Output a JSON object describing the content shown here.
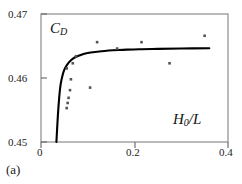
{
  "panel": {
    "label": "(a)"
  },
  "axes": {
    "x_ticks": [
      "0",
      "0.2",
      "0.4"
    ],
    "y_ticks": [
      "0.47",
      "0.46",
      "0.45"
    ],
    "x_title_main": "H",
    "x_title_sub": "0",
    "x_title_tail": "/L",
    "y_title_main": "C",
    "y_title_sub": "D"
  },
  "chart_data": {
    "type": "scatter",
    "title": "",
    "subtitle": "",
    "xlabel": "H_0/L",
    "ylabel": "C_D",
    "xlim": [
      0,
      0.4
    ],
    "ylim": [
      0.45,
      0.47
    ],
    "xticks": [
      0,
      0.2,
      0.4
    ],
    "yticks": [
      0.45,
      0.46,
      0.47
    ],
    "grid": false,
    "legend": null,
    "annotations": [
      "(a)"
    ],
    "series": [
      {
        "name": "experimental data",
        "type": "scatter",
        "marker": "small filled square",
        "color": "#555555",
        "points": [
          [
            0.055,
            0.4553
          ],
          [
            0.057,
            0.4561
          ],
          [
            0.059,
            0.4569
          ],
          [
            0.062,
            0.4581
          ],
          [
            0.064,
            0.4598
          ],
          [
            0.055,
            0.4615
          ],
          [
            0.068,
            0.4623
          ],
          [
            0.075,
            0.4634
          ],
          [
            0.105,
            0.4585
          ],
          [
            0.12,
            0.4656
          ],
          [
            0.163,
            0.4646
          ],
          [
            0.215,
            0.4656
          ],
          [
            0.275,
            0.4623
          ],
          [
            0.35,
            0.4666
          ]
        ]
      },
      {
        "name": "theoretical curve",
        "type": "line",
        "color": "#000000",
        "points": [
          [
            0.033,
            0.45
          ],
          [
            0.036,
            0.454
          ],
          [
            0.039,
            0.457
          ],
          [
            0.042,
            0.459
          ],
          [
            0.046,
            0.4604
          ],
          [
            0.05,
            0.4613
          ],
          [
            0.056,
            0.4621
          ],
          [
            0.063,
            0.4627
          ],
          [
            0.072,
            0.4632
          ],
          [
            0.085,
            0.4636
          ],
          [
            0.1,
            0.4639
          ],
          [
            0.12,
            0.4641
          ],
          [
            0.145,
            0.4643
          ],
          [
            0.175,
            0.4644
          ],
          [
            0.21,
            0.4645
          ],
          [
            0.25,
            0.46455
          ],
          [
            0.3,
            0.4646
          ],
          [
            0.36,
            0.46465
          ]
        ]
      }
    ]
  }
}
